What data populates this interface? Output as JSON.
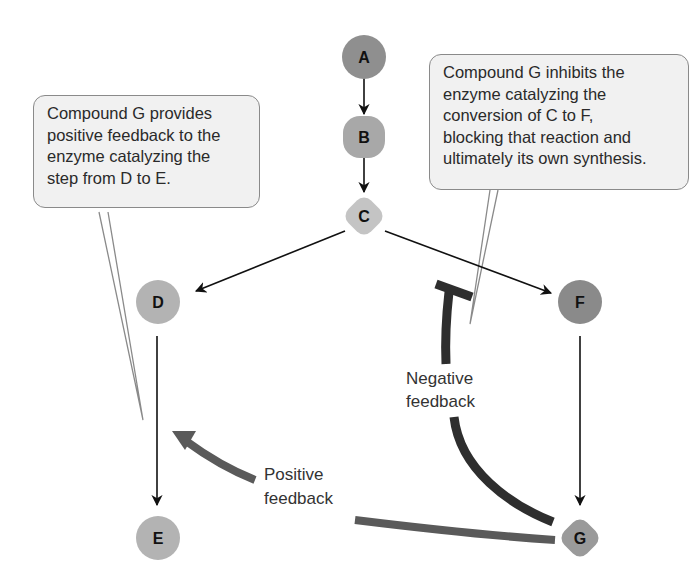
{
  "nodes": [
    {
      "id": "A",
      "label": "A",
      "x": 364,
      "y": 58,
      "shape": "circle",
      "color": "#8f8f8f"
    },
    {
      "id": "B",
      "label": "B",
      "x": 364,
      "y": 137,
      "shape": "rounded",
      "color": "#a8a8a8"
    },
    {
      "id": "C",
      "label": "C",
      "x": 364,
      "y": 216,
      "shape": "diamond",
      "color": "#c4c4c4"
    },
    {
      "id": "D",
      "label": "D",
      "x": 158,
      "y": 302,
      "shape": "circle",
      "color": "#b3b3b3"
    },
    {
      "id": "F",
      "label": "F",
      "x": 580,
      "y": 302,
      "shape": "circle",
      "color": "#8a8a8a"
    },
    {
      "id": "E",
      "label": "E",
      "x": 158,
      "y": 538,
      "shape": "circle",
      "color": "#b3b3b3"
    },
    {
      "id": "G",
      "label": "G",
      "x": 580,
      "y": 538,
      "shape": "diamond",
      "color": "#9a9a9a"
    }
  ],
  "edges": [
    {
      "from": "A",
      "to": "B"
    },
    {
      "from": "B",
      "to": "C"
    },
    {
      "from": "C",
      "to": "D"
    },
    {
      "from": "C",
      "to": "F"
    },
    {
      "from": "D",
      "to": "E"
    },
    {
      "from": "F",
      "to": "G"
    }
  ],
  "feedback": {
    "negative": {
      "label_line1": "Negative",
      "label_line2": "feedback",
      "color": "#2e2e2e",
      "from": "G",
      "inhibits": "C to F"
    },
    "positive": {
      "label_line1": "Positive",
      "label_line2": "feedback",
      "color": "#5a5a5a",
      "from": "G",
      "targets": "D to E"
    }
  },
  "callouts": {
    "left": {
      "lines": [
        "Compound G provides",
        "positive feedback to the",
        "enzyme catalyzing the",
        "step from D to E."
      ]
    },
    "right": {
      "lines": [
        "Compound G inhibits the",
        "enzyme catalyzing the",
        "conversion of C to F,",
        "blocking that reaction and",
        "ultimately its own synthesis."
      ]
    }
  }
}
